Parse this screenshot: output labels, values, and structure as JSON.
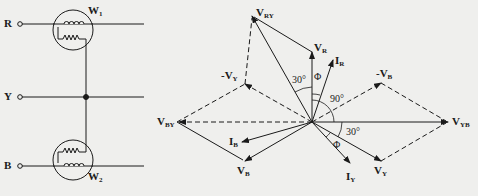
{
  "circuit": {
    "terminals": [
      "R",
      "Y",
      "B"
    ],
    "wattmeters": [
      {
        "name": "W",
        "sub": "1",
        "line": "R"
      },
      {
        "name": "W",
        "sub": "2",
        "line": "B"
      }
    ],
    "common_node": "Y"
  },
  "phasor_diagram": {
    "origin": [
      312,
      122
    ],
    "vectors": [
      {
        "id": "V_R",
        "main": "V",
        "sub": "R",
        "tip": [
          312,
          52
        ],
        "style": "solid"
      },
      {
        "id": "I_R",
        "main": "I",
        "sub": "R",
        "tip": [
          333,
          60
        ],
        "style": "solid"
      },
      {
        "id": "V_RY",
        "main": "V",
        "sub": "RY",
        "tip": [
          252,
          16
        ],
        "style": "solid"
      },
      {
        "id": "neg_V_Y",
        "main": "-V",
        "sub": "Y",
        "tip": [
          245,
          84
        ],
        "style": "dashed"
      },
      {
        "id": "neg_V_B",
        "main": "-V",
        "sub": "B",
        "tip": [
          381,
          83
        ],
        "style": "dashed"
      },
      {
        "id": "V_BY",
        "main": "V",
        "sub": "BY",
        "tip": [
          177,
          122
        ],
        "style": "dashed"
      },
      {
        "id": "V_YB",
        "main": "V",
        "sub": "YB",
        "tip": [
          448,
          122
        ],
        "style": "solid"
      },
      {
        "id": "V_B",
        "main": "V",
        "sub": "B",
        "tip": [
          245,
          161
        ],
        "style": "solid"
      },
      {
        "id": "I_B",
        "main": "I",
        "sub": "B",
        "tip": [
          242,
          142
        ],
        "style": "solid"
      },
      {
        "id": "V_Y",
        "main": "V",
        "sub": "Y",
        "tip": [
          381,
          161
        ],
        "style": "solid"
      },
      {
        "id": "I_Y",
        "main": "I",
        "sub": "Y",
        "tip": [
          350,
          163
        ],
        "style": "solid"
      }
    ],
    "angles": [
      {
        "label": "30°",
        "between": "V_RY and V_R"
      },
      {
        "label": "Φ",
        "between": "V_R and I_R"
      },
      {
        "label": "90°",
        "between": "V_R and V_YB"
      },
      {
        "label": "30°",
        "between": "V_YB and V_Y"
      },
      {
        "label": "Φ",
        "between": "V_Y and I_Y"
      }
    ]
  },
  "labels": {
    "R": "R",
    "Y": "Y",
    "B": "B",
    "W1": "W",
    "W1_sub": "1",
    "W2": "W",
    "W2_sub": "2",
    "VRY": "V",
    "VRY_sub": "RY",
    "VR": "V",
    "VR_sub": "R",
    "IR": "I",
    "IR_sub": "R",
    "nVY": "-V",
    "nVY_sub": "Y",
    "nVB": "-V",
    "nVB_sub": "B",
    "VBY": "V",
    "VBY_sub": "BY",
    "VYB": "V",
    "VYB_sub": "YB",
    "IB": "I",
    "IB_sub": "B",
    "VB": "V",
    "VB_sub": "B",
    "IY": "I",
    "IY_sub": "Y",
    "VY": "V",
    "VY_sub": "Y",
    "a30_top": "30°",
    "phi_top": "Φ",
    "a90": "90°",
    "a30_bot": "30°",
    "phi_bot": "Φ"
  }
}
